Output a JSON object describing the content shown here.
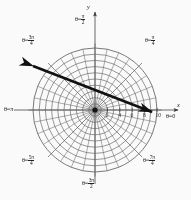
{
  "figure": {
    "type": "polar-grid-diagram",
    "title": "",
    "background": "#fdfdfd",
    "ink_color": "#222222",
    "grid_color": "#5a5a5a",
    "center": {
      "x": 95,
      "y": 110
    },
    "max_radius_px": 62
  },
  "axes": {
    "x_label": "x",
    "y_label": "y",
    "x_axis_arrow": true,
    "y_axis_arrow": true
  },
  "ticks": {
    "axis": "positive-x",
    "values": [
      "2",
      "4",
      "6",
      "8",
      "10"
    ],
    "positions_px": [
      12.4,
      24.8,
      37.2,
      49.6,
      62.0
    ]
  },
  "angle_labels": [
    {
      "name": "theta-pi-over-2",
      "prefix": "θ=",
      "num": "π",
      "den": "2",
      "x": 75,
      "y": 14,
      "align": "left"
    },
    {
      "name": "theta-3pi-over-4",
      "prefix": "θ=",
      "num": "3π",
      "den": "4",
      "x": 22,
      "y": 35,
      "align": "left"
    },
    {
      "name": "theta-pi-over-4",
      "prefix": "θ=",
      "num": "π",
      "den": "4",
      "x": 145,
      "y": 35,
      "align": "left"
    },
    {
      "name": "theta-pi",
      "prefix": "θ=",
      "num": "π",
      "den": "",
      "x": 4,
      "y": 106,
      "align": "left"
    },
    {
      "name": "theta-0",
      "prefix": "θ=",
      "num": "0",
      "den": "",
      "x": 166,
      "y": 113,
      "align": "left"
    },
    {
      "name": "theta-5pi-over-4",
      "prefix": "θ=",
      "num": "5π",
      "den": "4",
      "x": 22,
      "y": 155,
      "align": "left"
    },
    {
      "name": "theta-7pi-over-4",
      "prefix": "θ=",
      "num": "7π",
      "den": "4",
      "x": 143,
      "y": 155,
      "align": "left"
    },
    {
      "name": "theta-3pi-over-2",
      "prefix": "θ=",
      "num": "3π",
      "den": "2",
      "x": 82,
      "y": 178,
      "align": "left"
    }
  ],
  "grid": {
    "circle_count": 10,
    "circle_radii_px": [
      6.2,
      12.4,
      18.6,
      24.8,
      31.0,
      37.2,
      43.4,
      49.6,
      55.8,
      62.0
    ],
    "spoke_count": 32,
    "major_spoke_every": 4
  },
  "arrow_line": {
    "name": "double-headed-vector-line",
    "x1": 33,
    "y1": 66,
    "x2": 152,
    "y2": 112,
    "stroke_width": 2.6,
    "color": "#111111",
    "arrowhead_start": true,
    "arrowhead_end": true
  },
  "chart_data": {
    "type": "line",
    "coordinate_system": "polar",
    "xlabel": "x",
    "ylabel": "y",
    "radial_ticks": [
      2,
      4,
      6,
      8,
      10
    ],
    "radial_max": 10,
    "angular_labels": [
      "θ=0",
      "θ=π/4",
      "θ=π/2",
      "θ=3π/4",
      "θ=π",
      "θ=5π/4",
      "θ=3π/2",
      "θ=7π/4"
    ],
    "angular_values_rad": [
      0,
      0.7854,
      1.5708,
      2.3562,
      3.1416,
      3.927,
      4.7124,
      5.4978
    ],
    "grid": true,
    "legend": "none",
    "series": [
      {
        "name": "drawn-line",
        "description": "Thick double-headed straight line crossing the grid from upper-left to lower-right",
        "endpoints_polar": [
          {
            "r": 10.0,
            "theta_rad": 2.7646,
            "theta_deg": 158.4
          },
          {
            "r": 9.2,
            "theta_rad": 6.0806,
            "theta_deg": 348.4
          }
        ],
        "endpoints_cartesian": [
          {
            "x": -9.3,
            "y": 3.7
          },
          {
            "x": 9.0,
            "y": -1.8
          }
        ],
        "slope": -0.3,
        "passes_through_pole": false
      }
    ]
  }
}
